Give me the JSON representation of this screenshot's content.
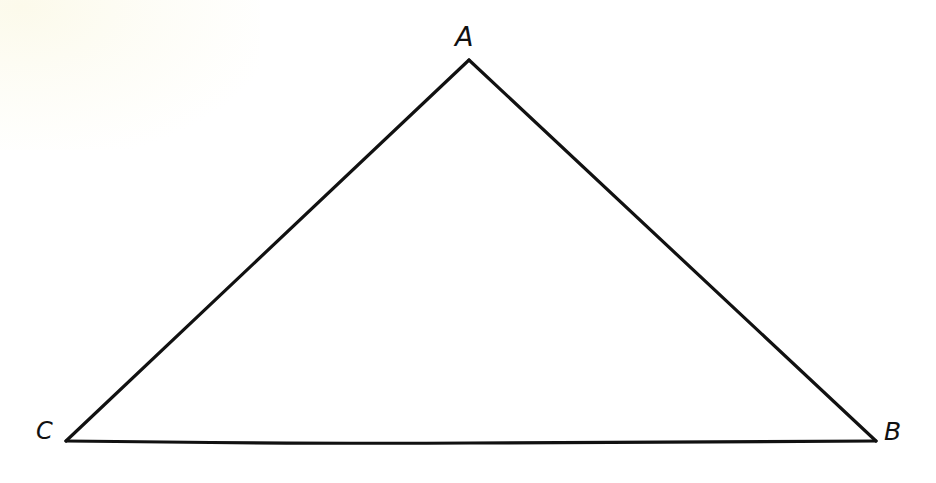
{
  "figure": {
    "kind": "geometry-figure",
    "shape": "triangle",
    "background_color": "#ffffff",
    "stroke_color": "#111111",
    "stroke_width": 3.2,
    "canvas": {
      "width": 936,
      "height": 483
    },
    "vertices": [
      {
        "id": "A",
        "label": "A",
        "x": 469,
        "y": 60,
        "role": "apex",
        "label_x": 466,
        "label_y": 38
      },
      {
        "id": "B",
        "label": "B",
        "x": 876,
        "y": 441,
        "role": "bottom-right",
        "label_x": 893,
        "label_y": 433
      },
      {
        "id": "C",
        "label": "C",
        "x": 66,
        "y": 441,
        "role": "bottom-left",
        "label_x": 44,
        "label_y": 433
      }
    ],
    "sides": [
      {
        "id": "CA",
        "from": "C",
        "to": "A"
      },
      {
        "id": "AB",
        "from": "A",
        "to": "B"
      },
      {
        "id": "BC",
        "from": "B",
        "to": "C"
      }
    ],
    "path": "M 66 441 L 469 60 L 876 441 Z"
  }
}
